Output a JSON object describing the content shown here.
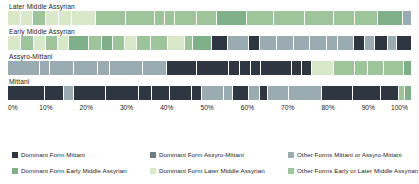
{
  "chart_data": {
    "type": "bar",
    "title": "",
    "subtitle": "",
    "xlabel": "",
    "ylabel": "",
    "orientation": "horizontal",
    "stacked": true,
    "normalized": true,
    "grid": false,
    "legend_position": "bottom",
    "xlim": [
      0,
      100
    ],
    "xtick_labels": [
      "0%",
      "10%",
      "20%",
      "30%",
      "40%",
      "50%",
      "60%",
      "70%",
      "80%",
      "90%",
      "100%"
    ],
    "xtick_values": [
      0,
      10,
      20,
      30,
      40,
      50,
      60,
      70,
      80,
      90,
      100
    ],
    "categories": [
      "Later Middle Assyrian",
      "Early Middle Assyrian",
      "Assyro-Mittani",
      "Mittani"
    ],
    "series": [
      {
        "name": "Dominant Form Mittani",
        "key": "dom_mittani",
        "color": "#2e3642",
        "values": [
          0.0,
          0.0,
          33.0,
          60.0
        ]
      },
      {
        "name": "Dominant Form Assyro-Mittani",
        "key": "dom_assyro_mittani",
        "color": "#6f7d83",
        "values": [
          0.0,
          0.0,
          0.0,
          8.0
        ]
      },
      {
        "name": "Other Forms Mittani or Assyro-Mittani",
        "key": "other_mittani_assyro",
        "color": "#9aabb2",
        "values": [
          2.0,
          45.0,
          43.0,
          24.0
        ]
      },
      {
        "name": "Dominant Form Early Middle Assyrian",
        "key": "dom_early_ma",
        "color": "#7fb08a",
        "values": [
          22.0,
          13.0,
          4.0,
          5.0
        ]
      },
      {
        "name": "Dominant Form Later Middle Assyrian",
        "key": "dom_later_ma",
        "color": "#d8e8c9",
        "values": [
          18.0,
          18.0,
          8.0,
          0.0
        ]
      },
      {
        "name": "Other Forms Early or Later Middle Assyrian",
        "key": "other_early_later_ma",
        "color": "#9dc49a",
        "values": [
          58.0,
          24.0,
          12.0,
          3.0
        ]
      }
    ],
    "rows": [
      {
        "label": "Later Middle Assyrian",
        "segments": [
          {
            "key": "dom_later_ma",
            "w": 3.2
          },
          {
            "key": "dom_later_ma",
            "w": 3.0
          },
          {
            "key": "other_early_later_ma",
            "w": 3.4
          },
          {
            "key": "dom_later_ma",
            "w": 3.2
          },
          {
            "key": "dom_later_ma",
            "w": 3.4
          },
          {
            "key": "dom_later_ma",
            "w": 6.0
          },
          {
            "key": "other_early_later_ma",
            "w": 7.6
          },
          {
            "key": "other_early_later_ma",
            "w": 7.2
          },
          {
            "key": "other_early_later_ma",
            "w": 2.6
          },
          {
            "key": "other_early_later_ma",
            "w": 2.6
          },
          {
            "key": "other_early_later_ma",
            "w": 5.4
          },
          {
            "key": "other_early_later_ma",
            "w": 5.2
          },
          {
            "key": "dom_early_ma",
            "w": 7.4
          },
          {
            "key": "other_early_later_ma",
            "w": 7.0
          },
          {
            "key": "other_early_later_ma",
            "w": 7.6
          },
          {
            "key": "other_early_later_ma",
            "w": 7.4
          },
          {
            "key": "other_early_later_ma",
            "w": 5.4
          },
          {
            "key": "other_early_later_ma",
            "w": 5.6
          },
          {
            "key": "dom_early_ma",
            "w": 6.4
          },
          {
            "key": "other_mittani_assyro",
            "w": 2.0
          }
        ]
      },
      {
        "label": "Early Middle Assyrian",
        "segments": [
          {
            "key": "dom_later_ma",
            "w": 3.6
          },
          {
            "key": "other_early_later_ma",
            "w": 3.4
          },
          {
            "key": "dom_later_ma",
            "w": 3.2
          },
          {
            "key": "other_early_later_ma",
            "w": 3.2
          },
          {
            "key": "dom_later_ma",
            "w": 3.0
          },
          {
            "key": "dom_early_ma",
            "w": 5.4
          },
          {
            "key": "other_early_later_ma",
            "w": 3.6
          },
          {
            "key": "dom_early_ma",
            "w": 3.0
          },
          {
            "key": "other_early_later_ma",
            "w": 3.4
          },
          {
            "key": "dom_later_ma",
            "w": 3.2
          },
          {
            "key": "other_early_later_ma",
            "w": 3.6
          },
          {
            "key": "other_early_later_ma",
            "w": 4.8
          },
          {
            "key": "dom_later_ma",
            "w": 4.6
          },
          {
            "key": "other_early_later_ma",
            "w": 2.2
          },
          {
            "key": "dom_early_ma",
            "w": 5.0
          },
          {
            "key": "dom_mittani",
            "w": 4.4
          },
          {
            "key": "other_mittani_assyro",
            "w": 5.6
          },
          {
            "key": "dom_mittani",
            "w": 3.0
          },
          {
            "key": "other_mittani_assyro",
            "w": 4.6
          },
          {
            "key": "other_mittani_assyro",
            "w": 4.6
          },
          {
            "key": "other_mittani_assyro",
            "w": 4.4
          },
          {
            "key": "other_mittani_assyro",
            "w": 4.4
          },
          {
            "key": "other_mittani_assyro",
            "w": 3.0
          },
          {
            "key": "other_mittani_assyro",
            "w": 4.4
          },
          {
            "key": "dom_mittani",
            "w": 3.0
          },
          {
            "key": "other_mittani_assyro",
            "w": 2.8
          },
          {
            "key": "dom_mittani",
            "w": 3.4
          },
          {
            "key": "other_mittani_assyro",
            "w": 2.4
          },
          {
            "key": "dom_mittani",
            "w": 3.8
          }
        ]
      },
      {
        "label": "Assyro-Mittani",
        "segments": [
          {
            "key": "other_mittani_assyro",
            "w": 8.0
          },
          {
            "key": "other_mittani_assyro",
            "w": 2.6
          },
          {
            "key": "other_mittani_assyro",
            "w": 6.0
          },
          {
            "key": "other_mittani_assyro",
            "w": 6.0
          },
          {
            "key": "other_mittani_assyro",
            "w": 3.0
          },
          {
            "key": "other_mittani_assyro",
            "w": 8.2
          },
          {
            "key": "other_mittani_assyro",
            "w": 6.0
          },
          {
            "key": "dom_mittani",
            "w": 7.6
          },
          {
            "key": "dom_mittani",
            "w": 8.0
          },
          {
            "key": "dom_mittani",
            "w": 2.6
          },
          {
            "key": "dom_mittani",
            "w": 2.8
          },
          {
            "key": "dom_mittani",
            "w": 2.6
          },
          {
            "key": "dom_mittani",
            "w": 7.6
          },
          {
            "key": "dom_mittani",
            "w": 2.6
          },
          {
            "key": "dom_mittani",
            "w": 2.4
          },
          {
            "key": "dom_later_ma",
            "w": 5.6
          },
          {
            "key": "other_early_later_ma",
            "w": 5.2
          },
          {
            "key": "other_early_later_ma",
            "w": 3.2
          },
          {
            "key": "other_early_later_ma",
            "w": 4.2
          },
          {
            "key": "other_early_later_ma",
            "w": 4.8
          },
          {
            "key": "dom_early_ma",
            "w": 1.8
          }
        ]
      },
      {
        "label": "Mittani",
        "segments": [
          {
            "key": "dom_mittani",
            "w": 9.2
          },
          {
            "key": "dom_mittani",
            "w": 4.6
          },
          {
            "key": "other_mittani_assyro",
            "w": 2.6
          },
          {
            "key": "dom_mittani",
            "w": 8.0
          },
          {
            "key": "dom_mittani",
            "w": 8.2
          },
          {
            "key": "dom_mittani",
            "w": 3.2
          },
          {
            "key": "dom_mittani",
            "w": 4.4
          },
          {
            "key": "dom_mittani",
            "w": 5.4
          },
          {
            "key": "dom_mittani",
            "w": 2.6
          },
          {
            "key": "other_mittani_assyro",
            "w": 5.4
          },
          {
            "key": "other_mittani_assyro",
            "w": 2.2
          },
          {
            "key": "dom_mittani",
            "w": 4.0
          },
          {
            "key": "other_mittani_assyro",
            "w": 2.8
          },
          {
            "key": "dom_mittani",
            "w": 2.0
          },
          {
            "key": "other_mittani_assyro",
            "w": 5.2
          },
          {
            "key": "other_mittani_assyro",
            "w": 8.2
          },
          {
            "key": "dom_mittani",
            "w": 7.6
          },
          {
            "key": "dom_mittani",
            "w": 7.0
          },
          {
            "key": "dom_mittani",
            "w": 4.4
          },
          {
            "key": "other_early_later_ma",
            "w": 1.6
          },
          {
            "key": "dom_early_ma",
            "w": 1.4
          }
        ]
      }
    ]
  },
  "legend": {
    "rows": [
      [
        {
          "label": "Dominant Form Mittani",
          "color": "#2e3642"
        },
        {
          "label": "Dominant Form Assyro-Mittani",
          "color": "#6f7d83"
        },
        {
          "label": "Other Forms Mittani or Assyro-Mittani",
          "color": "#9aabb2"
        }
      ],
      [
        {
          "label": "Dominant Form Early Middle Assyrian",
          "color": "#7fb08a"
        },
        {
          "label": "Dominant Form Later Middle Assyrian",
          "color": "#d8e8c9"
        },
        {
          "label": "Other Forms Early or Later Middle Assyrian",
          "color": "#9dc49a"
        }
      ]
    ]
  }
}
